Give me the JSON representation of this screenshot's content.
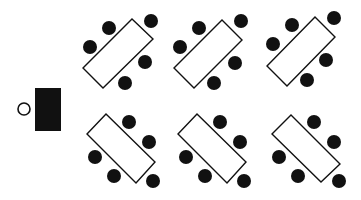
{
  "diagram": {
    "colors": {
      "background": "#ffffff",
      "ink": "#111111",
      "table_fill": "#ffffff",
      "chair_fill": "#111111"
    },
    "teacher": {
      "desk": {
        "x": 35,
        "y": 88,
        "w": 26,
        "h": 43
      },
      "seat": {
        "cx": 24,
        "cy": 109,
        "r": 7
      }
    },
    "groups": [
      {
        "id": "top-left",
        "table": [
          [
            132,
            19
          ],
          [
            153,
            39
          ],
          [
            103,
            88
          ],
          [
            83,
            68
          ]
        ],
        "chairs": [
          [
            109,
            28
          ],
          [
            151,
            21
          ],
          [
            90,
            47
          ],
          [
            145,
            62
          ],
          [
            125,
            83
          ]
        ]
      },
      {
        "id": "top-middle",
        "table": [
          [
            222,
            20
          ],
          [
            242,
            40
          ],
          [
            194,
            88
          ],
          [
            174,
            68
          ]
        ],
        "chairs": [
          [
            199,
            28
          ],
          [
            241,
            21
          ],
          [
            180,
            47
          ],
          [
            235,
            63
          ],
          [
            214,
            83
          ]
        ]
      },
      {
        "id": "top-right",
        "table": [
          [
            315,
            17
          ],
          [
            335,
            37
          ],
          [
            287,
            86
          ],
          [
            267,
            66
          ]
        ],
        "chairs": [
          [
            292,
            25
          ],
          [
            334,
            18
          ],
          [
            273,
            44
          ],
          [
            326,
            60
          ],
          [
            307,
            80
          ]
        ]
      },
      {
        "id": "bottom-left",
        "table": [
          [
            106,
            114
          ],
          [
            155,
            162
          ],
          [
            136,
            183
          ],
          [
            87,
            134
          ]
        ],
        "chairs": [
          [
            129,
            122
          ],
          [
            149,
            142
          ],
          [
            95,
            157
          ],
          [
            114,
            176
          ],
          [
            153,
            181
          ]
        ]
      },
      {
        "id": "bottom-middle",
        "table": [
          [
            197,
            114
          ],
          [
            246,
            162
          ],
          [
            227,
            183
          ],
          [
            178,
            134
          ]
        ],
        "chairs": [
          [
            220,
            122
          ],
          [
            240,
            142
          ],
          [
            186,
            157
          ],
          [
            205,
            176
          ],
          [
            244,
            181
          ]
        ]
      },
      {
        "id": "bottom-right",
        "table": [
          [
            291,
            115
          ],
          [
            340,
            164
          ],
          [
            321,
            182
          ],
          [
            272,
            134
          ]
        ],
        "chairs": [
          [
            314,
            122
          ],
          [
            334,
            142
          ],
          [
            279,
            157
          ],
          [
            298,
            176
          ],
          [
            339,
            181
          ]
        ]
      }
    ],
    "chair_radius": 7
  }
}
